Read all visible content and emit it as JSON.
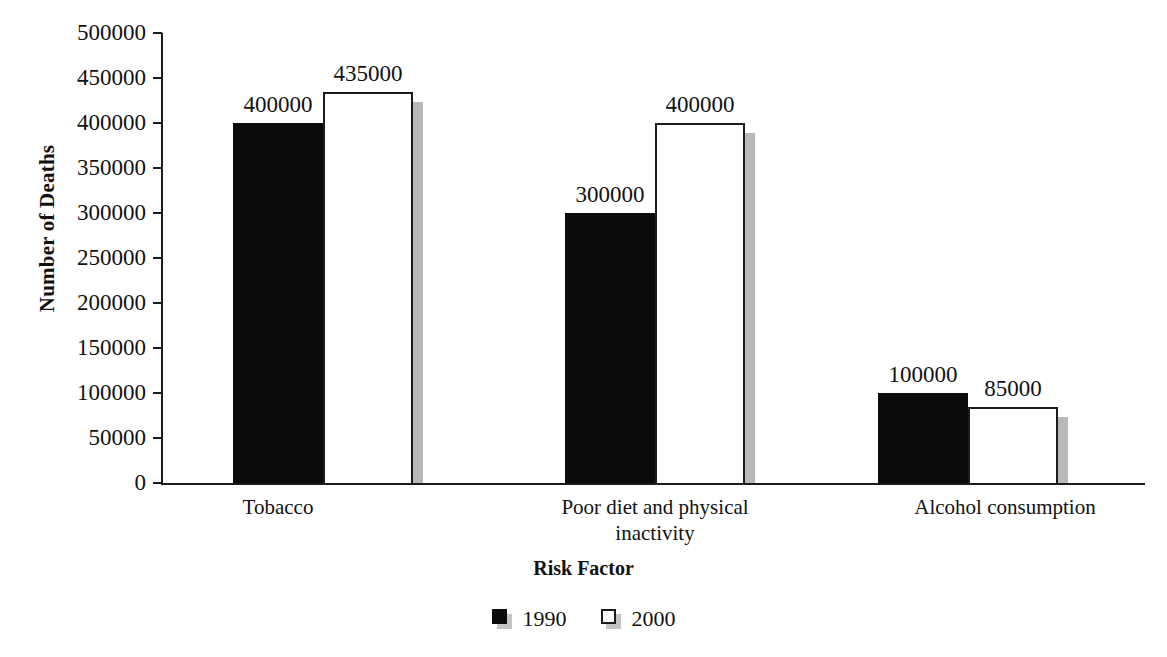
{
  "chart_data": {
    "type": "bar",
    "title": "",
    "xlabel": "Risk Factor",
    "ylabel": "Number of Deaths",
    "categories": [
      "Tobacco",
      "Poor diet and physical inactivity",
      "Alcohol consumption"
    ],
    "series": [
      {
        "name": "1990",
        "color": "#000000",
        "values": [
          400000,
          300000,
          100000
        ]
      },
      {
        "name": "2000",
        "color": "#ffffff",
        "values": [
          435000,
          400000,
          85000
        ]
      }
    ],
    "value_labels": [
      [
        "400000",
        "435000"
      ],
      [
        "300000",
        "400000"
      ],
      [
        "100000",
        "85000"
      ]
    ],
    "ylim": [
      0,
      500000
    ],
    "ytick_values": [
      0,
      50000,
      100000,
      150000,
      200000,
      250000,
      300000,
      350000,
      400000,
      450000,
      500000
    ],
    "ytick_labels": [
      "0",
      "50000",
      "100000",
      "150000",
      "200000",
      "250000",
      "300000",
      "350000",
      "400000",
      "450000",
      "500000"
    ],
    "grid": false,
    "legend_position": "bottom",
    "legend_entries": [
      "1990",
      "2000"
    ]
  },
  "axes": {
    "y_title": "Number of Deaths",
    "x_title": "Risk Factor"
  },
  "categories": {
    "c0_line1": "Tobacco",
    "c0_line2": "",
    "c1_line1": "Poor diet and physical",
    "c1_line2": "inactivity",
    "c2_line1": "Alcohol consumption",
    "c2_line2": ""
  },
  "legend": {
    "items": [
      {
        "label": "1990"
      },
      {
        "label": "2000"
      }
    ]
  }
}
